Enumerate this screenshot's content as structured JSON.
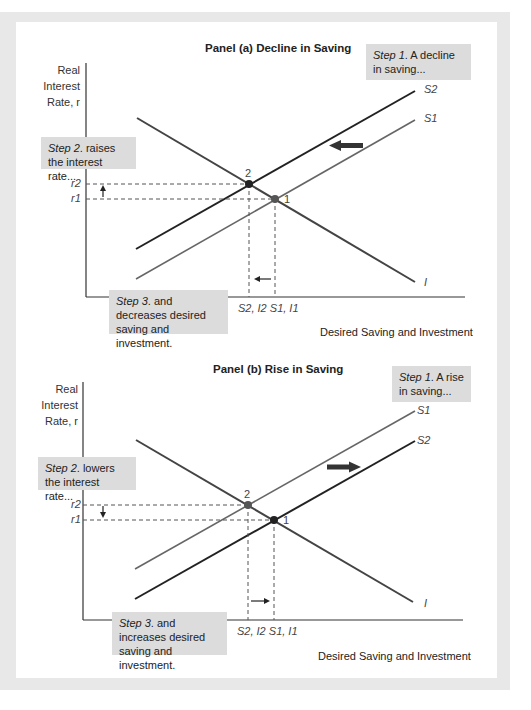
{
  "figure": {
    "panels": [
      {
        "id": "a",
        "title": "Panel (a) Decline in Saving",
        "y_axis_label_lines": [
          "Real",
          "Interest",
          "Rate, r"
        ],
        "x_axis_label": "Desired Saving and Investment",
        "step1": {
          "prefix": "Step 1",
          "text": ". A decline in saving..."
        },
        "step2": {
          "prefix": "Step 2",
          "text": ". raises the interest rate..."
        },
        "step3": {
          "prefix": "Step 3",
          "text": ". and decreases desired saving and investment."
        },
        "curve_labels": {
          "upper": "S2",
          "lower": "S1",
          "investment": "I"
        },
        "rate_labels": {
          "upper": "r2",
          "lower": "r1"
        },
        "equilibrium_labels": {
          "new": "2",
          "old": "1"
        },
        "quantity_labels": "S2, I2  S1, I1",
        "shift_direction": "left"
      },
      {
        "id": "b",
        "title": "Panel (b) Rise in Saving",
        "y_axis_label_lines": [
          "Real",
          "Interest",
          "Rate, r"
        ],
        "x_axis_label": "Desired Saving and Investment",
        "step1": {
          "prefix": "Step 1",
          "text": ". A rise in saving..."
        },
        "step2": {
          "prefix": "Step 2",
          "text": ". lowers the interest rate..."
        },
        "step3": {
          "prefix": "Step 3",
          "text": ". and increases desired saving and investment."
        },
        "curve_labels": {
          "upper": "S1",
          "lower": "S2",
          "investment": "I"
        },
        "rate_labels": {
          "upper": "r2",
          "lower": "r1"
        },
        "equilibrium_labels": {
          "new": "2",
          "old": "1"
        },
        "quantity_labels": "S2, I2  S1, I1",
        "shift_direction": "right"
      }
    ],
    "colors": {
      "frame": "#e8e8e8",
      "step_box": "#dcdcdc",
      "dark_line": "#2a2a2a",
      "gray_line": "#6a6a6a"
    }
  }
}
